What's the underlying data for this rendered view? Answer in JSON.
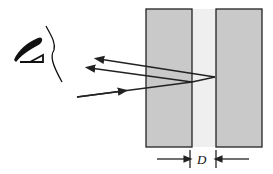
{
  "diagram": {
    "type": "thin-film interference (two plates with air gap)",
    "observer": {
      "icon": "eye-icon"
    },
    "plates": [
      {
        "name": "left-plate",
        "x": 146,
        "y": 9,
        "width": 46,
        "height": 138,
        "fill": "#c9c9c9"
      },
      {
        "name": "right-plate",
        "x": 216,
        "y": 9,
        "width": 46,
        "height": 138,
        "fill": "#c9c9c9"
      }
    ],
    "gap": {
      "x": 192,
      "width": 24,
      "fill": "#efefef"
    },
    "rays": [
      {
        "name": "incident-ray",
        "from": [
          77,
          97
        ],
        "to": [
          192,
          82
        ]
      },
      {
        "name": "reflected-ray-1",
        "from": [
          192,
          82
        ],
        "to": [
          88,
          68
        ]
      },
      {
        "name": "reflected-ray-2",
        "from": [
          215,
          77
        ],
        "to": [
          97,
          59
        ]
      }
    ],
    "dimension": {
      "label": "D",
      "left_tick_x": 190,
      "right_tick_x": 216,
      "y": 159
    },
    "colors": {
      "line": "#222222",
      "plate": "#c9c9c9",
      "gap": "#efefef"
    }
  }
}
